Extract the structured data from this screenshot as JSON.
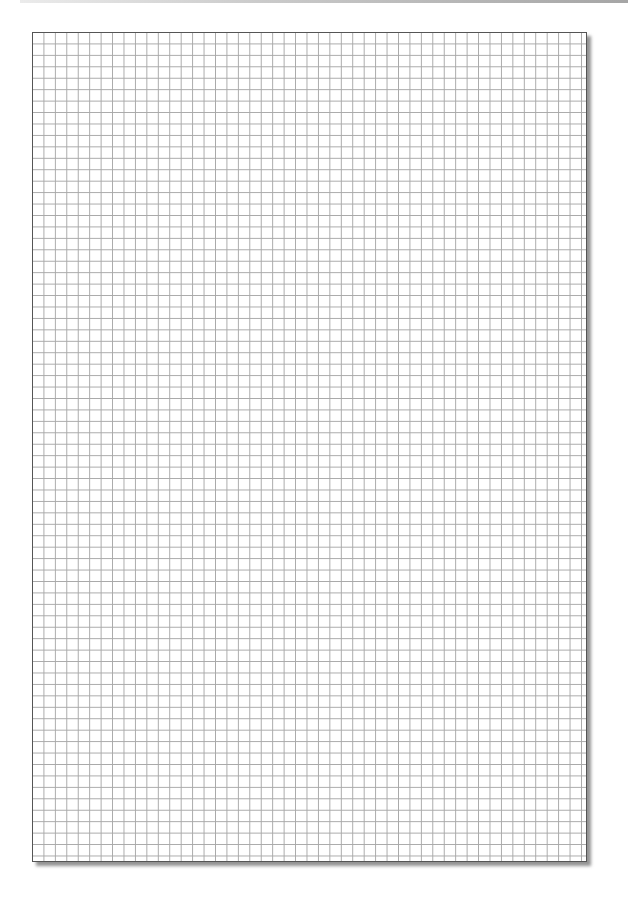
{
  "page": {
    "type": "graph-paper",
    "grid": {
      "cell_size_px": 11.45,
      "columns": 48,
      "rows": 72,
      "line_color": "#a8a8a8",
      "border_color": "#555555"
    },
    "background": "#ffffff"
  }
}
